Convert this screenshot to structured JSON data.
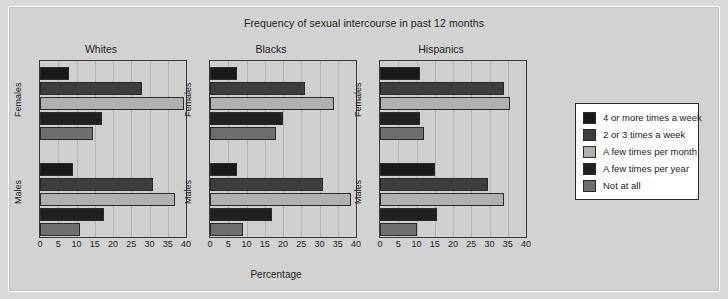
{
  "chart_data": {
    "type": "bar",
    "title": "Frequency of sexual intercourse in past 12 months",
    "xlabel": "Percentage",
    "ylabel": "",
    "xlim": [
      0,
      40
    ],
    "xticks": [
      0,
      5,
      10,
      15,
      20,
      25,
      30,
      35,
      40
    ],
    "grid": true,
    "orientation": "horizontal",
    "legend_position": "right",
    "categories": [
      "Females",
      "Males"
    ],
    "series": [
      {
        "name": "4 or more times a week",
        "color": "#1a1a1a"
      },
      {
        "name": "2 or 3 times a week",
        "color": "#3d3d3d"
      },
      {
        "name": "A few times per month",
        "color": "#b0b0b0"
      },
      {
        "name": "A few times per year",
        "color": "#202020"
      },
      {
        "name": "Not at all",
        "color": "#6e6e6e"
      }
    ],
    "panels": [
      {
        "name": "Whites",
        "groups": [
          {
            "name": "Females",
            "values": [
              8,
              28,
              39.5,
              17,
              14.5
            ]
          },
          {
            "name": "Males",
            "values": [
              9,
              31,
              37,
              17.5,
              11
            ]
          }
        ]
      },
      {
        "name": "Blacks",
        "groups": [
          {
            "name": "Females",
            "values": [
              7.5,
              26,
              34,
              20,
              18
            ]
          },
          {
            "name": "Males",
            "values": [
              7.5,
              31,
              38.5,
              17,
              9
            ]
          }
        ]
      },
      {
        "name": "Hispanics",
        "groups": [
          {
            "name": "Females",
            "values": [
              11,
              34,
              35.5,
              11,
              12
            ]
          },
          {
            "name": "Males",
            "values": [
              15,
              29.5,
              34,
              15.5,
              10
            ]
          }
        ]
      }
    ]
  },
  "legend": {
    "items": [
      "4 or more times a week",
      "2 or 3 times a week",
      "A few times per month",
      "A few times per year",
      "Not at all"
    ]
  }
}
